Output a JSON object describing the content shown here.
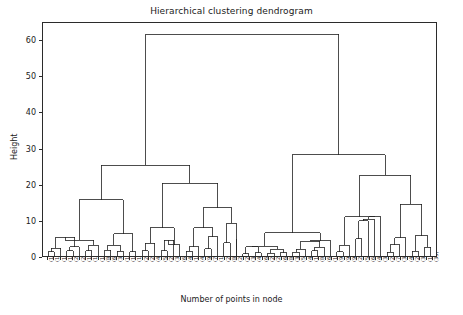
{
  "chart_data": {
    "type": "dendrogram",
    "title": "Hierarchical clustering dendrogram",
    "xlabel": "Number of points in node",
    "ylabel": "Height",
    "ylim": [
      0,
      65
    ],
    "yticks": [
      0,
      10,
      20,
      30,
      40,
      50,
      60
    ],
    "grid": false,
    "legend": null,
    "leaf_labels": [
      "(10)",
      "(13)",
      "(11)",
      "(19)",
      "(20)",
      "(27)",
      "(16)",
      "(12)",
      "(13)",
      "(8)",
      "(66)",
      "(3)",
      "(12)",
      "(12)",
      "(12)",
      "(20)",
      "(22)",
      "(48)",
      "(52)",
      "(20)",
      "(30)",
      "(68)",
      "(46)",
      "(18)",
      "(49)",
      "(97)",
      "(76)",
      "(124)",
      "(2)",
      "(8)",
      "(23)",
      "(267)",
      "(3)",
      "(4)",
      "(6)",
      "(241)",
      "(22)",
      "(68)",
      "(8)",
      "(3)",
      "(5)",
      "(4)",
      "(110)",
      "(8)",
      "(6)",
      "(11)",
      "(95)",
      "(98)",
      "(97)",
      "(2)",
      "(56)",
      "(60)",
      "(45)",
      "(31)",
      "(20)",
      "(7)",
      "(33)",
      "(47)",
      "(20)",
      "(32)",
      "(14)",
      "(33)"
    ],
    "root_height": 61.8,
    "major_merges": [
      {
        "name": "root",
        "height": 61.8
      },
      {
        "name": "left-cluster",
        "height": 25.3
      },
      {
        "name": "right-cluster",
        "height": 28.2
      },
      {
        "name": "left-a",
        "height": 15.7
      },
      {
        "name": "left-b",
        "height": 20.3
      },
      {
        "name": "right-a",
        "height": 6.5
      },
      {
        "name": "right-b",
        "height": 22.5
      },
      {
        "name": "right-b1",
        "height": 11.0
      },
      {
        "name": "right-b2",
        "height": 14.5
      },
      {
        "name": "mid-1",
        "height": 13.5
      },
      {
        "name": "mid-2",
        "height": 7.9
      },
      {
        "name": "mid-3",
        "height": 7.9
      },
      {
        "name": "mid-4",
        "height": 9.2
      },
      {
        "name": "mid-5",
        "height": 10.2
      },
      {
        "name": "mid-6",
        "height": 8.0
      }
    ],
    "line_color": "#1f1f1f",
    "axes_color": "#2b2b2b"
  },
  "axis": {
    "yticks": [
      "60",
      "50",
      "40",
      "30",
      "20",
      "10",
      "0"
    ],
    "ylabel": "Height",
    "xlabel": "Number of points in node"
  },
  "header": {
    "title": "Hierarchical clustering dendrogram"
  }
}
